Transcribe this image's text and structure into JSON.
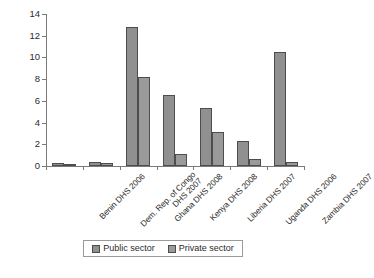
{
  "chart_data": {
    "type": "bar",
    "title": "",
    "subtitle": "",
    "xlabel": "",
    "ylabel": "",
    "ylim": [
      0,
      14
    ],
    "yticks": [
      0,
      2,
      4,
      6,
      8,
      10,
      12,
      14
    ],
    "grid": false,
    "legend_position": "bottom",
    "categories": [
      "Benin DHS 2006",
      "Dem. Rep. of Congo DHS 2007",
      "Ghana DHS 2008",
      "Kenya DHS 2008",
      "Liberia DHS 2007",
      "Uganda DHS 2006",
      "Zambia DHS 2007"
    ],
    "series": [
      {
        "name": "Public sector",
        "color": "#909090",
        "values": [
          0.3,
          0.4,
          12.8,
          6.5,
          5.3,
          2.35,
          10.5
        ]
      },
      {
        "name": "Private sector",
        "color": "#9a9a9a",
        "values": [
          0.15,
          0.25,
          8.2,
          1.1,
          3.1,
          0.65,
          0.35
        ]
      }
    ]
  },
  "legend": {
    "items": [
      {
        "label": "Public sector",
        "color": "#909090"
      },
      {
        "label": "Private sector",
        "color": "#9a9a9a"
      }
    ]
  },
  "footnote": ""
}
